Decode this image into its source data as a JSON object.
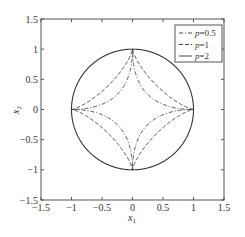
{
  "chart_data": {
    "type": "line",
    "title": "",
    "xlabel": "x1",
    "ylabel": "x2",
    "xlim": [
      -1.5,
      1.5
    ],
    "ylim": [
      -1.5,
      1.5
    ],
    "xticks": [
      -1.5,
      -1,
      -0.5,
      0,
      0.5,
      1,
      1.5
    ],
    "yticks": [
      -1.5,
      -1,
      -0.5,
      0,
      0.5,
      1,
      1.5
    ],
    "xtick_labels": [
      "−1.5",
      "−1",
      "−0.5",
      "0",
      "0.5",
      "1",
      "1.5"
    ],
    "ytick_labels": [
      "−1.5",
      "−1",
      "−0.5",
      "0",
      "0.5",
      "1",
      "1.5"
    ],
    "grid": false,
    "legend_position": "upper right",
    "series": [
      {
        "name": "p=0.5",
        "label_var": "p",
        "label_val": "=0.5",
        "style": "dashdot",
        "shape": "superellipse",
        "exponent": 0.5,
        "description": "concave astroid-like curve through (1,0),(0,1),(-1,0),(0,-1)"
      },
      {
        "name": "p=1",
        "label_var": "p",
        "label_val": "=1",
        "style": "dashed",
        "shape": "superellipse",
        "exponent": 0.75,
        "description": "concave curve through (1,0),(0,1),(-1,0),(0,-1), less pinched than p=0.5"
      },
      {
        "name": "p=2",
        "label_var": "p",
        "label_val": "=2",
        "style": "solid",
        "shape": "superellipse",
        "exponent": 2,
        "description": "unit circle"
      }
    ]
  }
}
